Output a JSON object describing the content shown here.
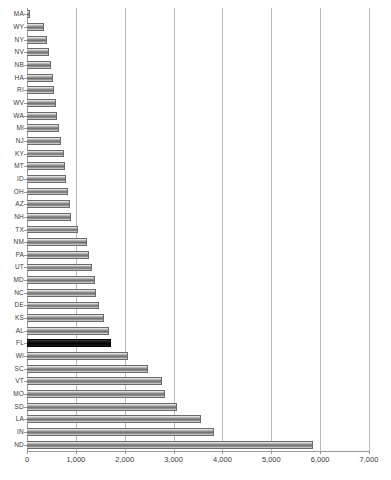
{
  "chart_data": {
    "type": "bar",
    "orientation": "horizontal",
    "title": "",
    "subtitle": "",
    "xlabel": "",
    "ylabel": "",
    "xlim": [
      0,
      7000
    ],
    "ylim": null,
    "grid": true,
    "legend": null,
    "xticks": [
      0,
      1000,
      2000,
      3000,
      4000,
      5000,
      6000,
      7000
    ],
    "xtick_labels": [
      "0",
      "1,000",
      "2,000",
      "3,000",
      "4,000",
      "5,000",
      "6,000",
      "7,000"
    ],
    "categories": [
      "MA",
      "WY",
      "NY",
      "NV",
      "NB",
      "HA",
      "RI",
      "WV",
      "WA",
      "MI",
      "NJ",
      "KY",
      "MT",
      "ID",
      "OH",
      "AZ",
      "NH",
      "TX",
      "NM",
      "PA",
      "UT",
      "MD",
      "NC",
      "DE",
      "KS",
      "AL",
      "FL",
      "WI",
      "SC",
      "VT",
      "MO",
      "SD",
      "LA",
      "IN",
      "ND"
    ],
    "values": [
      60,
      350,
      400,
      450,
      490,
      530,
      560,
      590,
      620,
      650,
      700,
      750,
      780,
      800,
      830,
      870,
      900,
      1050,
      1220,
      1270,
      1340,
      1390,
      1420,
      1470,
      1570,
      1670,
      1720,
      2070,
      2480,
      2760,
      2830,
      3080,
      3560,
      3820,
      5850
    ],
    "highlight_category": "FL",
    "series": [
      {
        "name": "value",
        "values": [
          60,
          350,
          400,
          450,
          490,
          530,
          560,
          590,
          620,
          650,
          700,
          750,
          780,
          800,
          830,
          870,
          900,
          1050,
          1220,
          1270,
          1340,
          1390,
          1420,
          1470,
          1570,
          1670,
          1720,
          2070,
          2480,
          2760,
          2830,
          3080,
          3560,
          3820,
          5850
        ]
      }
    ],
    "colors": {
      "bar_fill": "#8f8f8f",
      "bar_edge": "#6b6b6b",
      "highlight_fill": "#000000",
      "gridline": "#b9b9b9",
      "axis": "#9a9a9a",
      "text": "#3a3a3a",
      "background": "#ffffff"
    }
  }
}
